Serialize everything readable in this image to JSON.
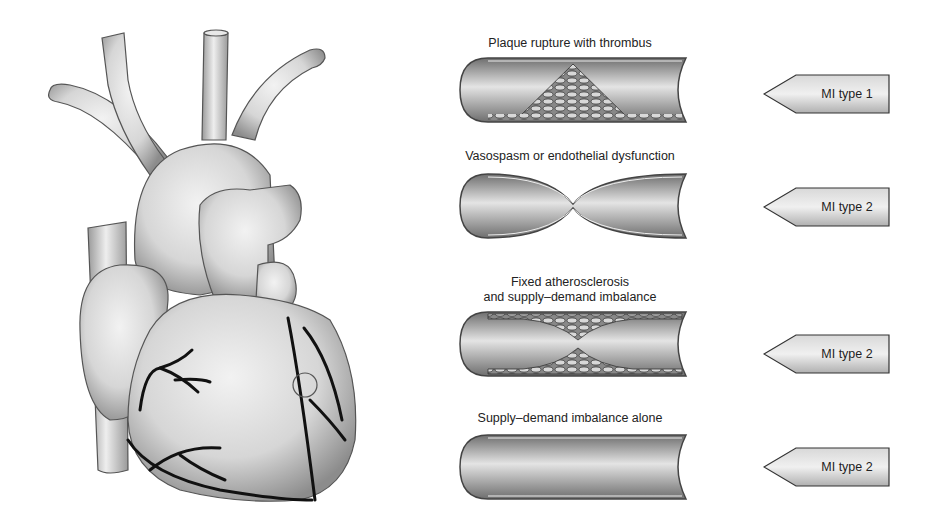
{
  "figure": {
    "heart": {
      "name": "heart-illustration",
      "annotation": "circle marking lesion site on coronary artery"
    },
    "panels": [
      {
        "label_lines": [
          "Plaque rupture with thrombus"
        ],
        "vessel": "plaque-rupture-thrombus",
        "tag": "MI type 1"
      },
      {
        "label_lines": [
          "Vasospasm or endothelial dysfunction"
        ],
        "vessel": "vasospasm",
        "tag": "MI type 2"
      },
      {
        "label_lines": [
          "Fixed atherosclerosis",
          "and supply–demand imbalance"
        ],
        "vessel": "fixed-atherosclerosis",
        "tag": "MI type 2"
      },
      {
        "label_lines": [
          "Supply–demand imbalance alone"
        ],
        "vessel": "normal-vessel",
        "tag": "MI type 2"
      }
    ]
  },
  "colors": {
    "outline": "#3a3a3a",
    "fill_light": "#f0f0f0",
    "fill_dark": "#8a8a8a",
    "artery": "#111111"
  }
}
